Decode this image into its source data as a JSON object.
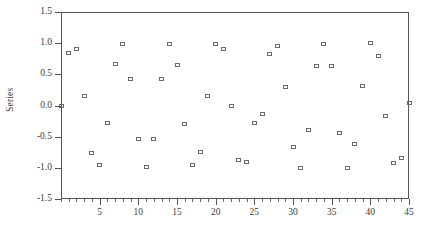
{
  "chart_data": {
    "type": "scatter",
    "title": "",
    "xlabel": "",
    "ylabel": "Series",
    "xlim": [
      0,
      45
    ],
    "ylim": [
      -1.5,
      1.5
    ],
    "grid": false,
    "legend": null,
    "marker": "open-square",
    "marker_color": "#6b6b6b",
    "x_ticks": [
      5,
      10,
      15,
      20,
      25,
      30,
      35,
      40,
      45
    ],
    "x_tick_labels": [
      "5",
      "10",
      "15",
      "20",
      "25",
      "30",
      "35",
      "40",
      "45"
    ],
    "x_minor_tick_step": 1,
    "y_ticks": [
      1.5,
      1.0,
      0.5,
      0.0,
      -0.5,
      -1.0,
      -1.5
    ],
    "y_tick_labels": [
      "1.5",
      "1.0",
      "0.5",
      "0.0",
      "-0.5",
      "-1.0",
      "-1.5"
    ],
    "series": [
      {
        "name": "Series",
        "x": [
          0,
          1,
          2,
          3,
          4,
          5,
          6,
          7,
          8,
          9,
          10,
          11,
          12,
          13,
          14,
          15,
          16,
          17,
          18,
          19,
          20,
          21,
          22,
          23,
          24,
          25,
          26,
          27,
          28,
          29,
          30,
          31,
          32,
          33,
          34,
          35,
          36,
          37,
          38,
          39,
          40,
          41,
          42,
          43,
          44,
          45
        ],
        "y": [
          0.0,
          0.84,
          0.91,
          0.15,
          -0.76,
          -0.96,
          -0.28,
          0.66,
          0.99,
          0.42,
          -0.54,
          -0.99,
          -0.54,
          0.42,
          0.99,
          0.65,
          -0.29,
          -0.96,
          -0.75,
          0.15,
          0.99,
          0.9,
          0.0,
          -0.87,
          -0.91,
          -0.28,
          -0.14,
          0.82,
          0.96,
          0.29,
          -0.66,
          -1.0,
          -0.4,
          0.64,
          0.99,
          0.64,
          -0.44,
          -1.0,
          -0.62,
          0.31,
          1.0,
          0.79,
          -0.17,
          -0.92,
          -0.85,
          0.04
        ]
      }
    ]
  },
  "axes": {
    "y_label": "Series"
  }
}
